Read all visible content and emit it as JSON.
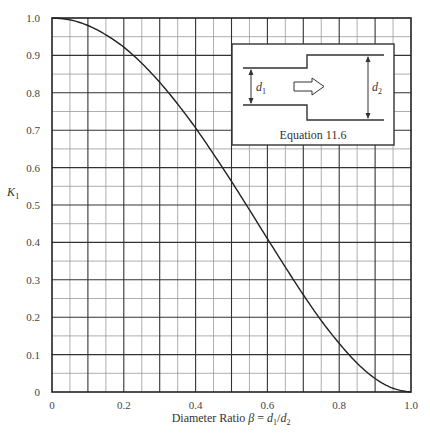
{
  "chart_data": {
    "type": "line",
    "title": "",
    "xlabel": "Diameter Ratio β = d1/d2",
    "xlabel_parts": {
      "prefix": "Diameter Ratio ",
      "beta": "β",
      "eq": " = ",
      "d": "d",
      "sub1": "1",
      "slash": "/",
      "sub2": "2"
    },
    "ylabel": "K1",
    "ylabel_parts": {
      "main": "K",
      "sub": "1"
    },
    "xlim": [
      0,
      1.0
    ],
    "ylim": [
      0,
      1.0
    ],
    "x_ticks": [
      "0",
      "0.2",
      "0.4",
      "0.6",
      "0.8",
      "1.0"
    ],
    "y_ticks": [
      "0",
      "0.1",
      "0.2",
      "0.3",
      "0.4",
      "0.5",
      "0.6",
      "0.7",
      "0.8",
      "0.9",
      "1.0"
    ],
    "grid": {
      "major": 0.1,
      "minor": 0.05
    },
    "series": [
      {
        "name": "K1 (sudden expansion)",
        "x": [
          0,
          0.05,
          0.1,
          0.15,
          0.2,
          0.25,
          0.3,
          0.35,
          0.4,
          0.45,
          0.5,
          0.55,
          0.6,
          0.65,
          0.7,
          0.75,
          0.8,
          0.85,
          0.9,
          0.95,
          1.0
        ],
        "values": [
          1.0,
          0.995,
          0.98,
          0.955,
          0.922,
          0.879,
          0.828,
          0.77,
          0.706,
          0.636,
          0.563,
          0.487,
          0.41,
          0.334,
          0.26,
          0.191,
          0.13,
          0.077,
          0.036,
          0.01,
          0.0
        ]
      }
    ],
    "inset": {
      "caption": "Equation 11.6",
      "d1_label": "d",
      "d1_sub": "1",
      "d2_label": "d",
      "d2_sub": "2"
    }
  }
}
